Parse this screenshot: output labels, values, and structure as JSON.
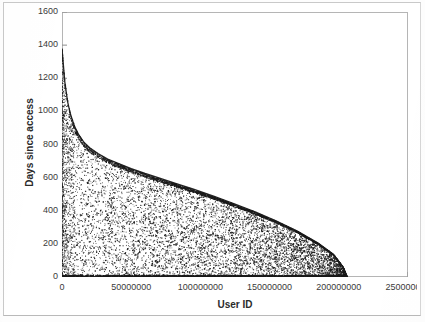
{
  "chart_data": {
    "type": "scatter",
    "title": "",
    "xlabel": "User ID",
    "ylabel": "Days since access",
    "xlim": [
      0,
      250000000
    ],
    "ylim": [
      0,
      1600
    ],
    "xticks": [
      0,
      50000000,
      100000000,
      150000000,
      200000000,
      250000000
    ],
    "xtick_labels": [
      "0",
      "50000000",
      "100000000",
      "150000000",
      "200000000",
      "250000000"
    ],
    "yticks": [
      0,
      200,
      400,
      600,
      800,
      1000,
      1200,
      1400,
      1600
    ],
    "ytick_labels": [
      "0",
      "200",
      "400",
      "600",
      "800",
      "1000",
      "1200",
      "1400",
      "1600"
    ],
    "grid": false,
    "legend": null,
    "marker_color": "#1a1a1a",
    "point_count": 9000,
    "envelope": {
      "name": "upper boundary of scatter",
      "x": [
        0,
        2000000,
        4000000,
        6000000,
        9000000,
        12000000,
        16000000,
        20000000,
        26000000,
        33000000,
        41000000,
        50000000,
        60000000,
        70000000,
        82000000,
        95000000,
        110000000,
        125000000,
        140000000,
        155000000,
        170000000,
        185000000,
        196000000,
        203000000,
        206000000
      ],
      "y": [
        1380,
        1180,
        1060,
        985,
        910,
        860,
        812,
        780,
        745,
        712,
        685,
        655,
        625,
        598,
        565,
        530,
        487,
        440,
        392,
        338,
        278,
        205,
        138,
        62,
        0
      ]
    },
    "x_max_data": 206000000,
    "y_max_data": 1380
  },
  "axes": {
    "x_axis_title": "User ID",
    "y_axis_title": "Days since access"
  }
}
